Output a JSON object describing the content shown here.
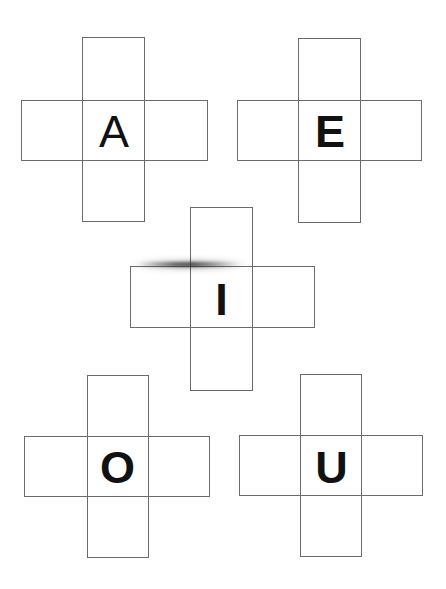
{
  "page": {
    "background_color": "#ffffff",
    "width": 446,
    "height": 589,
    "line_color": "#6b6b6b",
    "letter_color": "#111111"
  },
  "cards": [
    {
      "id": "card-a",
      "letter": "A",
      "vertical_rect": {
        "x": 82,
        "y": 37,
        "w": 63,
        "h": 185
      },
      "horizontal_rect": {
        "x": 21,
        "y": 100,
        "w": 187,
        "h": 61
      },
      "letter_box": {
        "x": 83,
        "y": 107,
        "w": 62,
        "h": 48
      },
      "font_size": 45,
      "font_weight": "400"
    },
    {
      "id": "card-e",
      "letter": "E",
      "vertical_rect": {
        "x": 298,
        "y": 38,
        "w": 63,
        "h": 185
      },
      "horizontal_rect": {
        "x": 237,
        "y": 100,
        "w": 185,
        "h": 61
      },
      "letter_box": {
        "x": 299,
        "y": 107,
        "w": 62,
        "h": 48
      },
      "font_size": 45,
      "font_weight": "700"
    },
    {
      "id": "card-i",
      "letter": "I",
      "vertical_rect": {
        "x": 190,
        "y": 207,
        "w": 63,
        "h": 184
      },
      "horizontal_rect": {
        "x": 130,
        "y": 266,
        "w": 185,
        "h": 62
      },
      "letter_box": {
        "x": 190,
        "y": 275,
        "w": 63,
        "h": 48
      },
      "font_size": 45,
      "font_weight": "700"
    },
    {
      "id": "card-o",
      "letter": "O",
      "vertical_rect": {
        "x": 87,
        "y": 375,
        "w": 62,
        "h": 183
      },
      "horizontal_rect": {
        "x": 24,
        "y": 436,
        "w": 186,
        "h": 61
      },
      "letter_box": {
        "x": 86,
        "y": 443,
        "w": 63,
        "h": 48
      },
      "font_size": 45,
      "font_weight": "700"
    },
    {
      "id": "card-u",
      "letter": "U",
      "vertical_rect": {
        "x": 300,
        "y": 374,
        "w": 62,
        "h": 183
      },
      "horizontal_rect": {
        "x": 239,
        "y": 435,
        "w": 184,
        "h": 61
      },
      "letter_box": {
        "x": 300,
        "y": 443,
        "w": 63,
        "h": 48
      },
      "font_size": 45,
      "font_weight": "700"
    }
  ],
  "artifacts": [
    {
      "id": "smudge-main",
      "x": 138,
      "y": 262,
      "w": 104,
      "h": 5
    },
    {
      "id": "smudge-soft",
      "x": 132,
      "y": 261,
      "w": 120,
      "h": 7
    }
  ]
}
